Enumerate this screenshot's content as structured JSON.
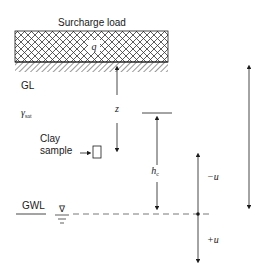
{
  "diagram": {
    "title": "Surcharge load",
    "surcharge_symbol": "q",
    "ground_label": "GL",
    "unit_weight_label": "γ",
    "unit_weight_sub": "sat",
    "sample_label_line1": "Clay",
    "sample_label_line2": "sample",
    "depth_label": "z",
    "capillary_label": "h",
    "capillary_sub": "c",
    "water_table_label": "GWL",
    "negative_pore_label": "−u",
    "positive_pore_label": "+u",
    "water_table_symbol": "∇"
  },
  "colors": {
    "line": "#1a1a1a",
    "dash": "#555555",
    "hatch": "#333333"
  }
}
